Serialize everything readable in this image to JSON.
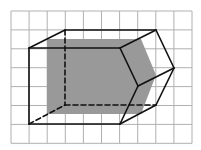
{
  "diagram": {
    "type": "pentagonal-prism-on-grid",
    "background": "#ffffff",
    "grid": {
      "columns": 10,
      "rows": 7,
      "x0": 11,
      "y0": 11,
      "cell_w": 18.1,
      "cell_h": 18.9,
      "color": "#b0b0b0"
    },
    "shadow": {
      "color": "#999999",
      "points": [
        [
          47,
          39
        ],
        [
          141,
          39
        ],
        [
          156,
          75
        ],
        [
          141,
          114
        ],
        [
          47,
          114
        ]
      ]
    },
    "edges_color": "#111111",
    "solid_edges": [
      [
        [
          29,
          48
        ],
        [
          120,
          48
        ]
      ],
      [
        [
          29,
          48
        ],
        [
          29,
          124
        ]
      ],
      [
        [
          29,
          124
        ],
        [
          120,
          124
        ]
      ],
      [
        [
          29,
          48
        ],
        [
          65,
          30
        ]
      ],
      [
        [
          65,
          30
        ],
        [
          156,
          30
        ]
      ],
      [
        [
          120,
          48
        ],
        [
          156,
          30
        ]
      ],
      [
        [
          156,
          30
        ],
        [
          174,
          68
        ]
      ],
      [
        [
          120,
          48
        ],
        [
          138,
          86
        ]
      ],
      [
        [
          138,
          86
        ],
        [
          174,
          68
        ]
      ],
      [
        [
          138,
          86
        ],
        [
          120,
          124
        ]
      ],
      [
        [
          174,
          68
        ],
        [
          156,
          105
        ]
      ],
      [
        [
          120,
          124
        ],
        [
          156,
          105
        ]
      ]
    ],
    "dashed_edges": [
      [
        [
          65,
          30
        ],
        [
          65,
          105
        ]
      ],
      [
        [
          65,
          105
        ],
        [
          156,
          105
        ]
      ],
      [
        [
          29,
          124
        ],
        [
          65,
          105
        ]
      ]
    ]
  }
}
